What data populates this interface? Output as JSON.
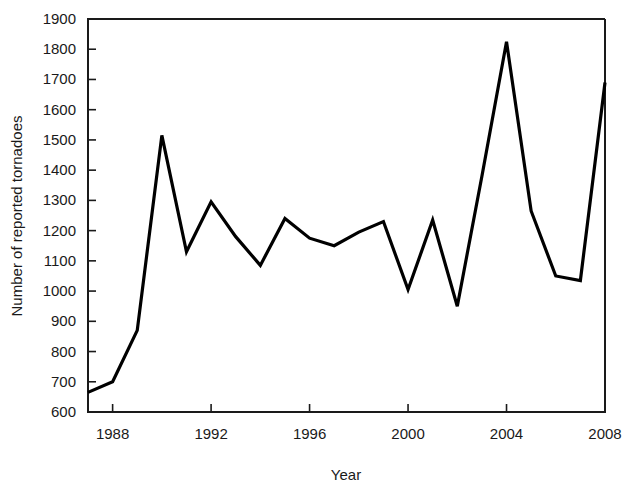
{
  "chart_data": {
    "type": "line",
    "title": "",
    "xlabel": "Year",
    "ylabel": "Number of reported tornadoes",
    "xlim": [
      1987,
      2008
    ],
    "ylim": [
      600,
      1900
    ],
    "grid": false,
    "legend": "none",
    "line_color": "#000000",
    "x": [
      1987,
      1988,
      1989,
      1990,
      1991,
      1992,
      1993,
      1994,
      1995,
      1996,
      1997,
      1998,
      1999,
      2000,
      2001,
      2002,
      2003,
      2004,
      2005,
      2006,
      2007,
      2008
    ],
    "values": [
      665,
      700,
      870,
      1515,
      1130,
      1295,
      1180,
      1085,
      1240,
      1175,
      1150,
      1195,
      1230,
      1005,
      1235,
      950,
      1380,
      1825,
      1265,
      1050,
      1035,
      1690
    ],
    "series": [
      {
        "name": "Number of reported tornadoes",
        "values": [
          665,
          700,
          870,
          1515,
          1130,
          1295,
          1180,
          1085,
          1240,
          1175,
          1150,
          1195,
          1230,
          1005,
          1235,
          950,
          1380,
          1825,
          1265,
          1050,
          1035,
          1690
        ]
      }
    ],
    "x_ticks": [
      1988,
      1992,
      1996,
      2000,
      2004,
      2008
    ],
    "x_tick_labels": [
      "1988",
      "1992",
      "1996",
      "2000",
      "2004",
      "2008"
    ],
    "y_ticks": [
      600,
      700,
      800,
      900,
      1000,
      1100,
      1200,
      1300,
      1400,
      1500,
      1600,
      1700,
      1800,
      1900
    ],
    "y_tick_labels": [
      "600",
      "700",
      "800",
      "900",
      "1000",
      "1100",
      "1200",
      "1300",
      "1400",
      "1500",
      "1600",
      "1700",
      "1800",
      "1900"
    ]
  },
  "axes": {
    "y_axis_title": "Number of reported tornadoes",
    "x_axis_title": "Year"
  }
}
